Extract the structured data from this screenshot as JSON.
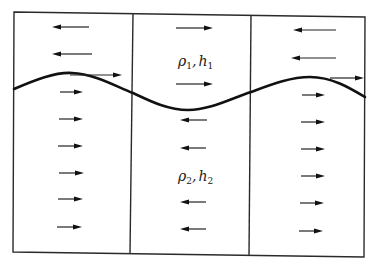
{
  "diagram": {
    "colors": {
      "background": "#ffffff",
      "lines": "#222222",
      "interface": "#111111"
    },
    "frame": {
      "top_left": [
        14,
        12
      ],
      "top_right": [
        365,
        17
      ],
      "bottom_right": [
        364,
        257
      ],
      "bottom_left": [
        13,
        252
      ]
    },
    "dividers": [
      {
        "x_top": 133,
        "y_top": 13,
        "x_bottom": 130,
        "y_bottom": 253
      },
      {
        "x_top": 251,
        "y_top": 15,
        "x_bottom": 249,
        "y_bottom": 255
      }
    ],
    "interface_path": "M14,89 C35,80 55,72 72,73 C95,74 115,86 133,93 C150,101 168,110 188,110 C210,110 230,99 251,92 C270,85 290,77 310,77 C332,77 350,88 365,97",
    "labels": {
      "upper": {
        "rho": "ρ",
        "rho_sub": "1",
        "sep": ",",
        "h": "h",
        "h_sub": "1",
        "x": 178,
        "y": 66
      },
      "lower": {
        "rho": "ρ",
        "rho_sub": "2",
        "sep": ",",
        "h": "h",
        "h_sub": "2",
        "x": 178,
        "y": 181
      }
    },
    "arrows": [
      {
        "region": "left-upper",
        "direction": "left",
        "x1": 52,
        "x2": 89,
        "y": 27
      },
      {
        "region": "left-upper",
        "direction": "left",
        "x1": 52,
        "x2": 92,
        "y": 54
      },
      {
        "region": "left-interface",
        "direction": "right",
        "x1": 70,
        "x2": 122,
        "y": 75
      },
      {
        "region": "left-lower",
        "direction": "right",
        "x1": 60,
        "x2": 83,
        "y": 92
      },
      {
        "region": "left-lower",
        "direction": "right",
        "x1": 59,
        "x2": 83,
        "y": 119
      },
      {
        "region": "left-lower",
        "direction": "right",
        "x1": 58,
        "x2": 83,
        "y": 146
      },
      {
        "region": "left-lower",
        "direction": "right",
        "x1": 59,
        "x2": 84,
        "y": 173
      },
      {
        "region": "left-lower",
        "direction": "right",
        "x1": 58,
        "x2": 83,
        "y": 199
      },
      {
        "region": "left-lower",
        "direction": "right",
        "x1": 57,
        "x2": 82,
        "y": 227
      },
      {
        "region": "middle-upper",
        "direction": "right",
        "x1": 176,
        "x2": 213,
        "y": 28
      },
      {
        "region": "middle-upper",
        "direction": "right",
        "x1": 176,
        "x2": 213,
        "y": 84
      },
      {
        "region": "middle-lower",
        "direction": "left",
        "x1": 180,
        "x2": 207,
        "y": 120
      },
      {
        "region": "middle-lower",
        "direction": "left",
        "x1": 180,
        "x2": 206,
        "y": 148
      },
      {
        "region": "middle-lower",
        "direction": "left",
        "x1": 180,
        "x2": 206,
        "y": 202
      },
      {
        "region": "middle-lower",
        "direction": "left",
        "x1": 180,
        "x2": 206,
        "y": 229
      },
      {
        "region": "right-upper",
        "direction": "left",
        "x1": 293,
        "x2": 336,
        "y": 30
      },
      {
        "region": "right-upper",
        "direction": "left",
        "x1": 291,
        "x2": 336,
        "y": 58
      },
      {
        "region": "right-interface",
        "direction": "right",
        "x1": 330,
        "x2": 364,
        "y": 78
      },
      {
        "region": "right-lower",
        "direction": "right",
        "x1": 302,
        "x2": 325,
        "y": 95
      },
      {
        "region": "right-lower",
        "direction": "right",
        "x1": 301,
        "x2": 325,
        "y": 122
      },
      {
        "region": "right-lower",
        "direction": "right",
        "x1": 301,
        "x2": 325,
        "y": 149
      },
      {
        "region": "right-lower",
        "direction": "right",
        "x1": 301,
        "x2": 325,
        "y": 176
      },
      {
        "region": "right-lower",
        "direction": "right",
        "x1": 300,
        "x2": 324,
        "y": 203
      },
      {
        "region": "right-lower",
        "direction": "right",
        "x1": 299,
        "x2": 323,
        "y": 231
      }
    ]
  }
}
